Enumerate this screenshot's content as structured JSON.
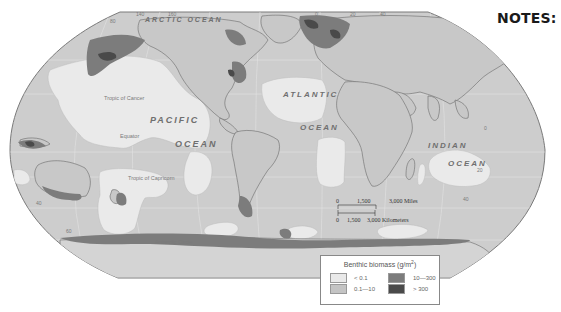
{
  "page": {
    "notes_title": "NOTES:"
  },
  "map": {
    "ocean_labels": {
      "arctic": "ARCTIC OCEAN",
      "pacific_1": "PACIFIC",
      "pacific_2": "OCEAN",
      "atlantic_1": "ATLANTIC",
      "atlantic_2": "OCEAN",
      "indian_1": "INDIAN",
      "indian_2": "OCEAN"
    },
    "lat_labels": {
      "tropic_cancer": "Tropic of Cancer",
      "equator": "Equator",
      "tropic_capricorn": "Tropic of Capricorn",
      "antarctic_circle": "Antarctic Circle"
    },
    "grid_labels": {
      "top": [
        "80",
        "140",
        "160",
        "180",
        "140",
        "0",
        "20",
        "40"
      ],
      "left_40": "40",
      "left_60": "60",
      "right_20": "20",
      "right_40": "40",
      "right_0": "0"
    },
    "scale_bar": {
      "miles": [
        "0",
        "1,500",
        "3,000 Miles"
      ],
      "km": [
        "0",
        "1,500",
        "3,000 Kilometers"
      ]
    },
    "colors": {
      "background": "#ffffff",
      "outline": "#7a7a7a",
      "land": "#c8c8c8",
      "lt_0_1": "#e9e9e9",
      "range_0_1_10": "#c4c4c4",
      "range_10_300": "#7c7c7c",
      "gt_300": "#4a4a4a",
      "border": "#707070"
    }
  },
  "legend": {
    "title": "Benthic biomass (g/m",
    "title_sup": "2",
    "title_close": ")",
    "items": [
      {
        "label": "< 0.1",
        "color": "#e9e9e9"
      },
      {
        "label": "0.1—10",
        "color": "#c4c4c4"
      },
      {
        "label": "10—300",
        "color": "#7c7c7c"
      },
      {
        "label": "> 300",
        "color": "#4a4a4a"
      }
    ]
  }
}
